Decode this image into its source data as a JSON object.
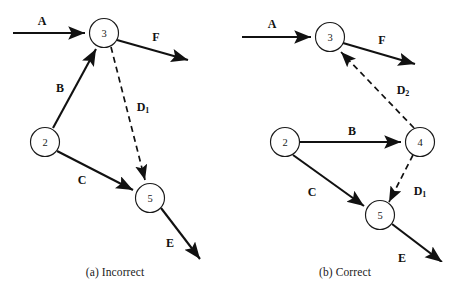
{
  "figure": {
    "type": "activity-on-arrow-network-diagram",
    "panels": [
      {
        "id": "a",
        "caption": "(a) Incorrect",
        "nodes": [
          {
            "id": "n3",
            "label": "3",
            "cx": 104,
            "cy": 33,
            "r": 14.5
          },
          {
            "id": "n2",
            "label": "2",
            "cx": 45,
            "cy": 142,
            "r": 14.5
          },
          {
            "id": "n5",
            "label": "5",
            "cx": 150,
            "cy": 198,
            "r": 14.5
          }
        ],
        "edges": [
          {
            "id": "A",
            "label": "A",
            "sub": "",
            "style": "solid",
            "from": "start",
            "to": "n3",
            "label_x": 42,
            "label_y": 21
          },
          {
            "id": "F",
            "label": "F",
            "sub": "",
            "style": "solid",
            "from": "n3",
            "to": "end",
            "label_x": 156,
            "label_y": 37
          },
          {
            "id": "B",
            "label": "B",
            "sub": "",
            "style": "solid",
            "from": "n2",
            "to": "n3",
            "label_x": 60,
            "label_y": 88
          },
          {
            "id": "C",
            "label": "C",
            "sub": "",
            "style": "solid",
            "from": "n2",
            "to": "n5",
            "label_x": 82,
            "label_y": 180
          },
          {
            "id": "E",
            "label": "E",
            "sub": "",
            "style": "solid",
            "from": "n5",
            "to": "end",
            "label_x": 170,
            "label_y": 243
          },
          {
            "id": "D1",
            "label": "D",
            "sub": "1",
            "style": "dashed",
            "from": "n3",
            "to": "n5",
            "label_x": 143,
            "label_y": 107
          }
        ]
      },
      {
        "id": "b",
        "caption": "(b) Correct",
        "nodes": [
          {
            "id": "n3",
            "label": "3",
            "cx": 100,
            "cy": 37,
            "r": 14.5
          },
          {
            "id": "n2",
            "label": "2",
            "cx": 55,
            "cy": 142,
            "r": 14.5
          },
          {
            "id": "n4",
            "label": "4",
            "cx": 190,
            "cy": 142,
            "r": 14.5
          },
          {
            "id": "n5",
            "label": "5",
            "cx": 150,
            "cy": 215,
            "r": 14.5
          }
        ],
        "edges": [
          {
            "id": "A",
            "label": "A",
            "sub": "",
            "style": "solid",
            "from": "start",
            "to": "n3",
            "label_x": 42,
            "label_y": 24
          },
          {
            "id": "F",
            "label": "F",
            "sub": "",
            "style": "solid",
            "from": "n3",
            "to": "end",
            "label_x": 152,
            "label_y": 40
          },
          {
            "id": "B",
            "label": "B",
            "sub": "",
            "style": "solid",
            "from": "n2",
            "to": "n4",
            "label_x": 122,
            "label_y": 131
          },
          {
            "id": "C",
            "label": "C",
            "sub": "",
            "style": "solid",
            "from": "n2",
            "to": "n5",
            "label_x": 82,
            "label_y": 192
          },
          {
            "id": "E",
            "label": "E",
            "sub": "",
            "style": "solid",
            "from": "n5",
            "to": "end",
            "label_x": 172,
            "label_y": 258
          },
          {
            "id": "D2",
            "label": "D",
            "sub": "2",
            "style": "dashed",
            "from": "n4",
            "to": "n3",
            "label_x": 173,
            "label_y": 90
          },
          {
            "id": "D1",
            "label": "D",
            "sub": "1",
            "style": "dashed",
            "from": "n4",
            "to": "n5",
            "label_x": 190,
            "label_y": 191
          }
        ]
      }
    ]
  }
}
